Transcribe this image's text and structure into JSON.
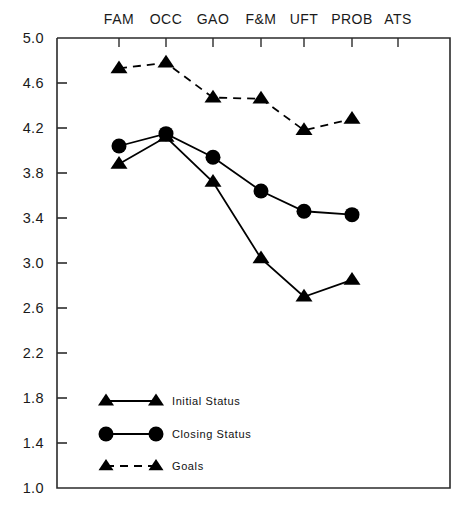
{
  "chart_data": {
    "type": "line",
    "title": "",
    "xlabel": "",
    "ylabel": "",
    "categories": [
      "FAM",
      "OCC",
      "GAO",
      "F&M",
      "UFT",
      "PROB",
      "ATS"
    ],
    "ylim": [
      1.0,
      5.0
    ],
    "y_ticks": [
      "5.0",
      "4.6",
      "4.2",
      "3.8",
      "3.4",
      "3.0",
      "2.6",
      "2.2",
      "1.8",
      "1.4",
      "1.0"
    ],
    "y_tick_values": [
      5.0,
      4.6,
      4.2,
      3.8,
      3.4,
      3.0,
      2.6,
      2.2,
      1.8,
      1.4,
      1.0
    ],
    "grid": false,
    "legend_position": "inside-lower-left",
    "series": [
      {
        "name": "Initial Status",
        "marker": "triangle",
        "line_style": "solid",
        "color": "#000000",
        "values": [
          3.88,
          4.12,
          3.72,
          3.04,
          2.7,
          2.85,
          null
        ]
      },
      {
        "name": "Closing Status",
        "marker": "circle",
        "line_style": "solid",
        "color": "#000000",
        "values": [
          4.04,
          4.15,
          3.94,
          3.64,
          3.46,
          3.43,
          null
        ]
      },
      {
        "name": "Goals",
        "marker": "triangle",
        "line_style": "dashed",
        "color": "#000000",
        "values": [
          4.73,
          4.78,
          4.47,
          4.46,
          4.18,
          4.28,
          null
        ]
      }
    ]
  },
  "axes": {
    "frame_color": "#2b2b2b",
    "tick_color": "#2b2b2b"
  },
  "legend": {
    "items": [
      {
        "label": "Initial Status"
      },
      {
        "label": "Closing Status"
      },
      {
        "label": "Goals"
      }
    ]
  }
}
